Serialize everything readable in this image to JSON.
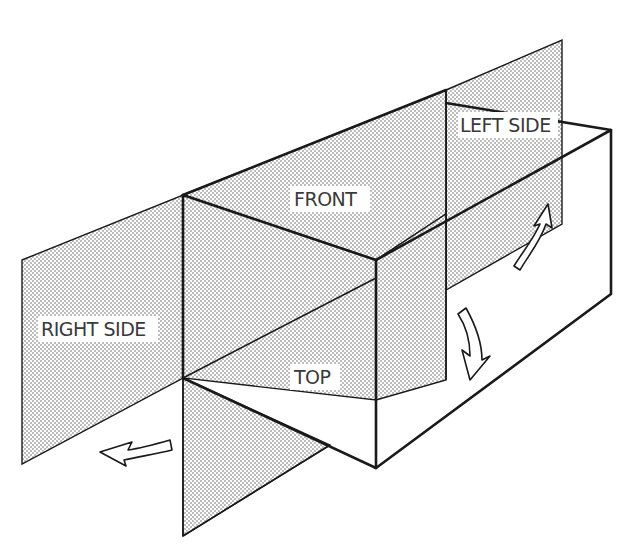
{
  "diagram": {
    "labels": {
      "left_side": "LEFT SIDE",
      "front": "FRONT",
      "right_side": "RIGHT SIDE",
      "top": "TOP"
    },
    "colors": {
      "line": "#1a1a1a",
      "dot": "#5a5a5a",
      "label": "#3a3a3a",
      "background": "#ffffff"
    },
    "arrows": [
      {
        "name": "left-side-rotate-arrow",
        "direction": "up-right"
      },
      {
        "name": "top-rotate-arrow",
        "direction": "down"
      },
      {
        "name": "right-side-rotate-arrow",
        "direction": "left"
      }
    ]
  }
}
